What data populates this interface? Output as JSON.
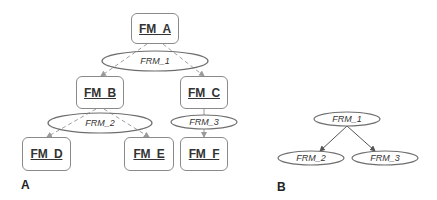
{
  "panel_a": {
    "label": "A",
    "feature_models": [
      {
        "id": "FM_A",
        "label": "FM_A",
        "x": 131,
        "y": 13,
        "w": 48,
        "h": 31
      },
      {
        "id": "FM_B",
        "label": "FM_B",
        "x": 76,
        "y": 76,
        "w": 48,
        "h": 33
      },
      {
        "id": "FM_C",
        "label": "FM_C",
        "x": 180,
        "y": 76,
        "w": 48,
        "h": 33
      },
      {
        "id": "FM_D",
        "label": "FM_D",
        "x": 22,
        "y": 137,
        "w": 49,
        "h": 34
      },
      {
        "id": "FM_E",
        "label": "FM_E",
        "x": 124,
        "y": 137,
        "w": 50,
        "h": 34
      },
      {
        "id": "FM_F",
        "label": "FM_F",
        "x": 180,
        "y": 137,
        "w": 48,
        "h": 34
      }
    ],
    "relations": [
      {
        "id": "FRM_1",
        "label": "FRM_1",
        "cx": 155,
        "cy": 61,
        "rx": 53,
        "ry": 10
      },
      {
        "id": "FRM_2",
        "label": "FRM_2",
        "cx": 100,
        "cy": 123,
        "rx": 52,
        "ry": 10
      },
      {
        "id": "FRM_3",
        "label": "FRM_3",
        "cx": 204,
        "cy": 122,
        "rx": 33,
        "ry": 7
      }
    ],
    "edges": [
      {
        "from": "FM_A",
        "via": "FRM_1",
        "to": "FM_B",
        "style": "dashed"
      },
      {
        "from": "FM_A",
        "via": "FRM_1",
        "to": "FM_C",
        "style": "dashed"
      },
      {
        "from": "FM_B",
        "via": "FRM_2",
        "to": "FM_D",
        "style": "dashed"
      },
      {
        "from": "FM_B",
        "via": "FRM_2",
        "to": "FM_E",
        "style": "dashed"
      },
      {
        "from": "FM_C",
        "via": "FRM_3",
        "to": "FM_F",
        "style": "solid"
      }
    ]
  },
  "panel_b": {
    "label": "B",
    "relations": [
      {
        "id": "FRM_1",
        "label": "FRM_1",
        "cx": 347,
        "cy": 119,
        "rx": 33,
        "ry": 7
      },
      {
        "id": "FRM_2",
        "label": "FRM_2",
        "cx": 311,
        "cy": 158,
        "rx": 33,
        "ry": 7
      },
      {
        "id": "FRM_3",
        "label": "FRM_3",
        "cx": 385,
        "cy": 158,
        "rx": 33,
        "ry": 7
      }
    ],
    "edges": [
      {
        "from": "FRM_1",
        "to": "FRM_2",
        "style": "solid"
      },
      {
        "from": "FRM_1",
        "to": "FRM_3",
        "style": "solid"
      }
    ]
  },
  "colors": {
    "box_border": "#8a8a8a",
    "ellipse_stroke": "#6e6e6e",
    "dashed_edge": "#a0a0a0",
    "solid_edge": "#555555",
    "text": "#333333"
  }
}
